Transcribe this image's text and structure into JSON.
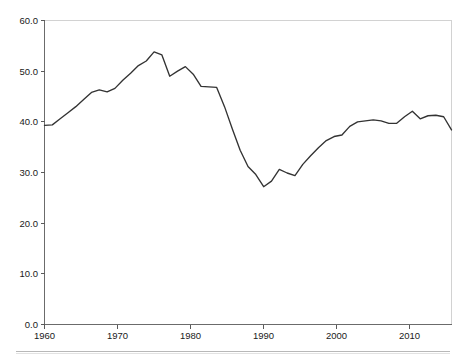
{
  "chart_data": {
    "type": "line",
    "title": "",
    "subtitle": "",
    "xlabel": "",
    "ylabel": "",
    "xlim": [
      1960,
      1960
    ],
    "ylim": [
      0.0,
      60.0
    ],
    "grid": false,
    "legend": null,
    "legend_position": "none",
    "y_tick_labels": [
      "60.0",
      "50.0",
      "40.0",
      "30.0",
      "20.0",
      "10.0",
      "0.0"
    ],
    "y_tick_values": [
      60.0,
      50.0,
      40.0,
      30.0,
      20.0,
      10.0,
      0.0
    ],
    "x_tick_labels": [
      "1960",
      "1970",
      "1980",
      "1990",
      "2000",
      "2010"
    ],
    "x_tick_values": [
      1960,
      1970,
      1980,
      1990,
      2000,
      2010
    ],
    "x_range": [
      1960,
      2012
    ],
    "series": [
      {
        "name": "series-1",
        "color": "#333333",
        "x": [
          1960,
          1961,
          1962,
          1963,
          1964,
          1965,
          1966,
          1967,
          1968,
          1969,
          1970,
          1971,
          1972,
          1973,
          1974,
          1975,
          1976,
          1977,
          1978,
          1979,
          1980,
          1981,
          1982,
          1983,
          1984,
          1985,
          1986,
          1987,
          1988,
          1989,
          1990,
          1991,
          1992,
          1993,
          1994,
          1995,
          1996,
          1997,
          1998,
          1999,
          2000,
          2001,
          2002,
          2003,
          2004,
          2005,
          2006,
          2007,
          2008,
          2009,
          2010,
          2011,
          2012
        ],
        "values": [
          39.3,
          39.4,
          40.6,
          41.8,
          43.0,
          44.4,
          45.8,
          46.3,
          45.9,
          46.6,
          48.2,
          49.6,
          51.1,
          52.0,
          53.8,
          53.2,
          49.0,
          50.0,
          50.9,
          49.4,
          47.0,
          46.9,
          46.8,
          43.0,
          38.6,
          34.4,
          31.2,
          29.6,
          27.2,
          28.3,
          30.6,
          29.9,
          29.4,
          31.6,
          33.3,
          34.9,
          36.3,
          37.1,
          37.4,
          39.1,
          40.0,
          40.2,
          40.4,
          40.2,
          39.7,
          39.7,
          41.0,
          42.1,
          40.6,
          41.2,
          41.3,
          41.0,
          38.4
        ]
      }
    ]
  },
  "figure": {
    "background_color": "#ffffff",
    "axis_color": "#6b6b6b",
    "frame_color": "#d2d2d2",
    "line_color": "#333333"
  },
  "footer": {
    "rule_visible": true
  }
}
